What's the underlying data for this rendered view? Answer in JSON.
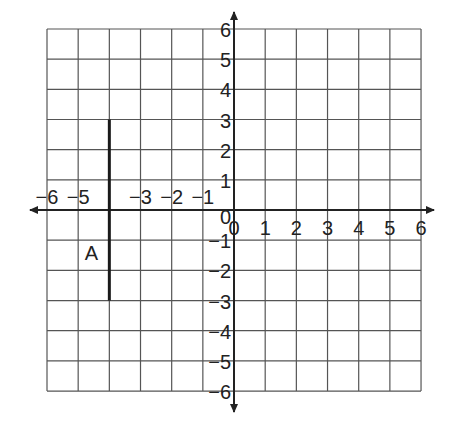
{
  "chart_data": {
    "type": "coordinate-grid",
    "title": "",
    "x_range": [
      -6,
      6
    ],
    "y_range": [
      -6,
      6
    ],
    "grid": true,
    "x_ticks": [
      "-6",
      "-5",
      "-3",
      "-2",
      "-1",
      "0",
      "1",
      "2",
      "3",
      "4",
      "5",
      "6"
    ],
    "x_tick_values": [
      -6,
      -5,
      -3,
      -2,
      -1,
      0,
      1,
      2,
      3,
      4,
      5,
      6
    ],
    "y_ticks": [
      "6",
      "5",
      "4",
      "3",
      "2",
      "1",
      "0",
      "-1",
      "-2",
      "-3",
      "-4",
      "-5",
      "-6"
    ],
    "y_tick_values": [
      6,
      5,
      4,
      3,
      2,
      1,
      0,
      -1,
      -2,
      -3,
      -4,
      -5,
      -6
    ],
    "segments": [
      {
        "label": "A",
        "x1": -4,
        "y1": 3,
        "x2": -4,
        "y2": -3
      }
    ]
  },
  "layout": {
    "grid_left": 47,
    "grid_top": 29,
    "cell_w": 31.17,
    "cell_h": 30.17,
    "x_axis_from": 30,
    "x_axis_to": 434,
    "y_axis_from": 12,
    "y_axis_to": 412
  },
  "colors": {
    "grid": "#555555",
    "axis": "#222222",
    "segment": "#1a1a1a",
    "background": "#ffffff"
  }
}
